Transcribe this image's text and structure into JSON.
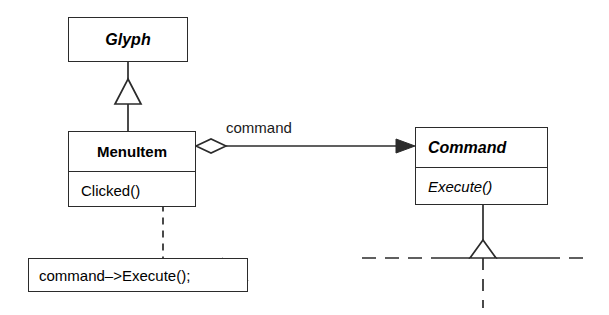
{
  "diagram": {
    "kind": "uml-class-diagram",
    "background_color": "#ffffff",
    "line_color": "#2b2b2b",
    "note_fold_color": "#b0b0b0",
    "classes": [
      {
        "id": "glyph",
        "name": "Glyph",
        "stereotype": "abstract",
        "operations": []
      },
      {
        "id": "menuitem",
        "name": "MenuItem",
        "stereotype": "concrete",
        "operations": [
          "Clicked()"
        ]
      },
      {
        "id": "command",
        "name": "Command",
        "stereotype": "abstract",
        "operations": [
          "Execute()"
        ]
      }
    ],
    "relationships": [
      {
        "id": "glyph-menuitem-inheritance",
        "type": "generalization",
        "from": "menuitem",
        "to": "glyph",
        "arrow": "hollow-triangle"
      },
      {
        "id": "menuitem-command-association",
        "type": "aggregation",
        "from": "menuitem",
        "to": "command",
        "label": "command",
        "source_decoration": "open-diamond",
        "target_decoration": "filled-arrow"
      },
      {
        "id": "command-subclasses-elided",
        "type": "generalization",
        "to": "command",
        "arrow": "hollow-triangle",
        "note": "elided subclasses shown as dashed lines"
      }
    ],
    "notes": [
      {
        "id": "clicked-note",
        "text": "command–>Execute();",
        "attached_to": "menuitem.Clicked()",
        "connector": "dashed",
        "marker": "lollipop-circle"
      }
    ]
  }
}
